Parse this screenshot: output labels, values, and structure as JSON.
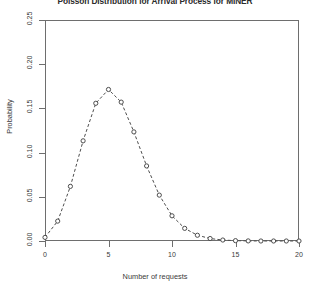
{
  "chart_data": {
    "type": "line",
    "title": "Poisson Distribution for Arrival Process for MINER",
    "xlabel": "Number of requests",
    "ylabel": "Probability",
    "x": [
      0,
      1,
      2,
      3,
      4,
      5,
      6,
      7,
      8,
      9,
      10,
      11,
      12,
      13,
      14,
      15,
      16,
      17,
      18,
      19,
      20
    ],
    "values": [
      0.0041,
      0.0225,
      0.0618,
      0.1133,
      0.1558,
      0.1714,
      0.1571,
      0.1234,
      0.0849,
      0.0519,
      0.0285,
      0.0143,
      0.0065,
      0.0028,
      0.0011,
      0.0004,
      0.0001,
      0.0,
      0.0,
      0.0,
      0.0
    ],
    "xtick_labels": [
      "0",
      "5",
      "10",
      "15",
      "20"
    ],
    "xtick_values": [
      0,
      5,
      10,
      15,
      20
    ],
    "ytick_labels": [
      "0.00",
      "0.05",
      "0.10",
      "0.15",
      "0.20",
      "0.25"
    ],
    "ytick_values": [
      0.0,
      0.05,
      0.1,
      0.15,
      0.2,
      0.25
    ],
    "xlim": [
      0,
      20
    ],
    "ylim": [
      0,
      0.25
    ],
    "grid": false,
    "legend": "none",
    "marker": "circle",
    "line_style": "dashed",
    "series_color": "#4d4d4d",
    "axis_color": "#6e6e6e"
  }
}
